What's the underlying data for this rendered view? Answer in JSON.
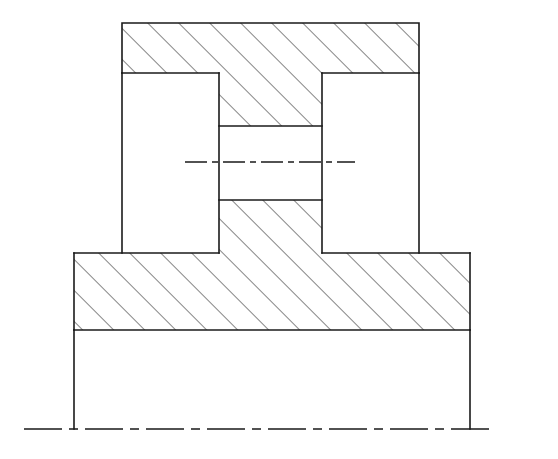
{
  "document": {
    "type": "engineering-drawing",
    "view": "sectional-view",
    "title": "Sectional View",
    "background_color": "#ffffff",
    "line_color": "#1a1a1a",
    "hatch_color": "#2b2b2b",
    "canvas": {
      "width": 558,
      "height": 459
    }
  },
  "drawing": {
    "line_weight_outline": 1.6,
    "line_weight_hatch": 1.1,
    "line_weight_center": 1.5,
    "hatch": {
      "angle_deg": 45,
      "direction": "lower-left-to-upper-right",
      "spacing_px": 15.5,
      "color": "#2b2b2b"
    },
    "center_dash_pattern": "22 5 6 5",
    "axis_dash_pattern": "38 7 9 7"
  },
  "geometry": {
    "top_bar": {
      "name": "Top cross bar",
      "hatched": true,
      "x1": 122,
      "y1": 23,
      "x2": 419,
      "y2": 73
    },
    "left_leg_void": {
      "name": "Left leg opening",
      "hatched": false,
      "x1": 122,
      "y1": 73,
      "x2": 219,
      "y2": 253
    },
    "right_leg_void": {
      "name": "Right leg opening",
      "hatched": false,
      "x1": 322,
      "y1": 73,
      "x2": 419,
      "y2": 253
    },
    "center_column_upper": {
      "name": "Center column upper section",
      "hatched": true,
      "x1": 219,
      "y1": 73,
      "x2": 322,
      "y2": 126
    },
    "center_column_gap": {
      "name": "Center column bore gap",
      "hatched": false,
      "x1": 219,
      "y1": 126,
      "x2": 322,
      "y2": 200
    },
    "center_column_lower": {
      "name": "Center column lower section",
      "hatched": true,
      "x1": 219,
      "y1": 200,
      "x2": 322,
      "y2": 253
    },
    "base_block": {
      "name": "Base flange block",
      "hatched": true,
      "x1": 74,
      "y1": 253,
      "x2": 470,
      "y2": 330
    },
    "skirt": {
      "name": "Lower skirt outline",
      "hatched": false,
      "x1": 74,
      "y1": 330,
      "x2": 470,
      "y2": 429
    },
    "horizontal_centerline": {
      "name": "Horizontal axis centerline",
      "x1": 185,
      "y1": 162,
      "x2": 355,
      "y2": 162
    },
    "bottom_axis_line": {
      "name": "Bottom reference axis",
      "x1": 24,
      "y1": 429,
      "x2": 490,
      "y2": 429
    }
  },
  "labels": {
    "annotations": [],
    "dimensions": [],
    "notes": []
  }
}
